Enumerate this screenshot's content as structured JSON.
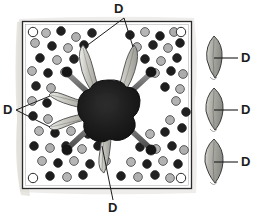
{
  "figure": {
    "background_color": "#ffffff",
    "paper_color": "#e8e8e6",
    "frame_stroke": "#2a2a2a",
    "label_color": "#1c1c1c"
  },
  "labels": [
    {
      "id": "d-top",
      "text": "D",
      "x": 118,
      "y": 3,
      "leader_count": 2
    },
    {
      "id": "d-left",
      "text": "D",
      "x": 4,
      "y": 104,
      "leader_count": 2
    },
    {
      "id": "d-bottom",
      "text": "D",
      "x": 108,
      "y": 203,
      "leader_count": 1
    },
    {
      "id": "d-inset-1",
      "text": "D",
      "x": 242,
      "y": 55,
      "leader_count": 1
    },
    {
      "id": "d-inset-2",
      "text": "D",
      "x": 242,
      "y": 107,
      "leader_count": 1
    },
    {
      "id": "d-inset-3",
      "text": "D",
      "x": 242,
      "y": 159,
      "leader_count": 1
    }
  ],
  "field": {
    "name": "tissue-field",
    "x": 22,
    "y": 21,
    "width": 170,
    "height": 168,
    "fill": "#ffffff",
    "stroke": "#2a2a2a"
  },
  "central_mass": {
    "name": "central-dark-mass",
    "cx": 108,
    "cy": 110,
    "radius": 30,
    "fill": "#1a1a1a",
    "lobes": 8
  },
  "granules": {
    "dark_color": "#1f1f1f",
    "mid_color": "#4a4a4a",
    "light_color": "#b4b4b4",
    "open_color": "#ffffff",
    "stroke": "#2a2a2a",
    "radius": 4.4,
    "counts": {
      "dark": 34,
      "light": 30,
      "open_corner": 4
    }
  },
  "radiating_structures": {
    "name": "radiating-rod-and-leaf",
    "rod_fill": "#6e6e6e",
    "rod_stroke": "#2e2e2e",
    "head_fill": "#1a1a1a",
    "leaf_fill": "#b9b9b2",
    "leaf_stroke": "#4a4a4a",
    "count": 4
  },
  "insets": [
    {
      "id": "inset-leaf-1",
      "cx": 214,
      "cy": 56,
      "w": 17,
      "h": 40,
      "fill": "#9b9b96",
      "stroke": "#3a3a3a"
    },
    {
      "id": "inset-leaf-2",
      "cx": 214,
      "cy": 108,
      "w": 18,
      "h": 40,
      "fill": "#9b9b96",
      "stroke": "#3a3a3a"
    },
    {
      "id": "inset-leaf-3",
      "cx": 214,
      "cy": 160,
      "w": 18,
      "h": 42,
      "fill": "#8f8f8a",
      "stroke": "#3a3a3a"
    }
  ]
}
